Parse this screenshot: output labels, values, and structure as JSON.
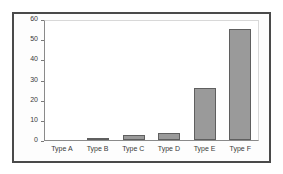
{
  "chart_data": {
    "type": "bar",
    "title": "",
    "xlabel": "",
    "ylabel": "",
    "categories": [
      "Type A",
      "Type B",
      "Type C",
      "Type D",
      "Type E",
      "Type F"
    ],
    "values": [
      0,
      1,
      2.5,
      3.5,
      26,
      55
    ],
    "ylim": [
      0,
      60
    ],
    "yticks": [
      0,
      10,
      20,
      30,
      40,
      50,
      60
    ],
    "ytick_labels": [
      "0",
      "10",
      "20",
      "30",
      "40",
      "50",
      "60"
    ],
    "grid": false,
    "legend": false,
    "legend_position": "none",
    "series": [
      {
        "name": "",
        "values": [
          0,
          1,
          2.5,
          3.5,
          26,
          55
        ]
      }
    ],
    "colors": {
      "bar_fill": "#9a9a9a",
      "bar_border": "#5f5f5f",
      "axis": "#8a8a8a",
      "plot_border": "#d8d8d8",
      "frame": "#4a4a4a",
      "background": "#ffffff",
      "text": "#3a3a3a"
    }
  }
}
